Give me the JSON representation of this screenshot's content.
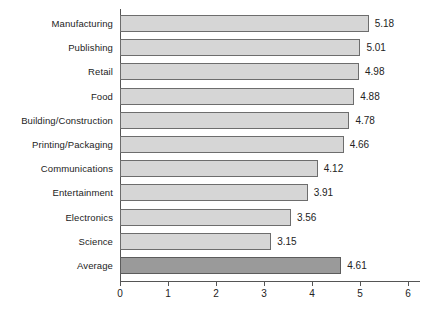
{
  "chart_data": {
    "type": "bar",
    "orientation": "horizontal",
    "title": "",
    "subtitle": "",
    "xlabel": "",
    "ylabel": "",
    "xlim": [
      0,
      6
    ],
    "xticks": [
      "0",
      "1",
      "2",
      "3",
      "4",
      "5",
      "6"
    ],
    "grid": false,
    "legend": null,
    "value_labels": true,
    "categories": [
      "Manufacturing",
      "Publishing",
      "Retail",
      "Food",
      "Building/Construction",
      "Printing/Packaging",
      "Communications",
      "Entertainment",
      "Electronics",
      "Science",
      "Average"
    ],
    "values": [
      5.18,
      5.01,
      4.98,
      4.88,
      4.78,
      4.66,
      4.12,
      3.91,
      3.56,
      3.15,
      4.61
    ],
    "value_text": [
      "5.18",
      "5.01",
      "4.98",
      "4.88",
      "4.78",
      "4.66",
      "4.12",
      "3.91",
      "3.56",
      "3.15",
      "4.61"
    ],
    "highlight_index": 10,
    "colors": {
      "bar_fill": "#d6d6d6",
      "bar_border": "#6d6d6d",
      "highlight_fill": "#9a9a9a",
      "highlight_border": "#5c5c5c",
      "axis": "#555555",
      "text": "#232323",
      "background": "#ffffff"
    }
  }
}
